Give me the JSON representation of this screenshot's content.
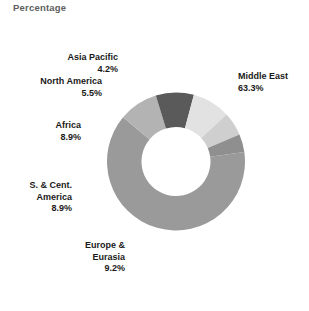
{
  "chart_title": "Percentage",
  "chart_data": {
    "type": "pie",
    "variant": "donut",
    "title": "Percentage",
    "subtitle": "",
    "xlabel": "",
    "ylabel": "",
    "units": "percent",
    "total": 100.0,
    "legend_position": "callout-labels",
    "grid": false,
    "start_angle_deg": -8,
    "direction": "clockwise",
    "inner_radius_ratio": 0.5,
    "categories": [
      "Middle East",
      "Europe & Eurasia",
      "S. & Cent. America",
      "Africa",
      "North America",
      "Asia Pacific"
    ],
    "values": [
      63.3,
      9.2,
      8.9,
      8.9,
      5.5,
      4.2
    ],
    "value_labels": [
      "63.3%",
      "9.2%",
      "8.9%",
      "8.9%",
      "5.5%",
      "4.2%"
    ],
    "colors": [
      "#9a9a9a",
      "#b3b3b3",
      "#5a5a5a",
      "#e2e2e2",
      "#cfcfcf",
      "#8f8f8f"
    ],
    "slices": [
      {
        "label": "Middle East",
        "label_line1": "Middle East",
        "value": 63.3,
        "value_label": "63.3%",
        "color": "#9a9a9a"
      },
      {
        "label": "Europe & Eurasia",
        "label_line1": "Europe &",
        "label_line2": "Eurasia",
        "value": 9.2,
        "value_label": "9.2%",
        "color": "#b3b3b3"
      },
      {
        "label": "S. & Cent. America",
        "label_line1": "S. & Cent.",
        "label_line2": "America",
        "value": 8.9,
        "value_label": "8.9%",
        "color": "#5a5a5a"
      },
      {
        "label": "Africa",
        "label_line1": "Africa",
        "value": 8.9,
        "value_label": "8.9%",
        "color": "#e2e2e2"
      },
      {
        "label": "North America",
        "label_line1": "North America",
        "value": 5.5,
        "value_label": "5.5%",
        "color": "#cfcfcf"
      },
      {
        "label": "Asia Pacific",
        "label_line1": "Asia Pacific",
        "value": 4.2,
        "value_label": "4.2%",
        "color": "#8f8f8f"
      }
    ]
  },
  "colors": {
    "title": "#5e5e5e",
    "label_text": "#1a1a1a",
    "background": "#ffffff",
    "middle_east": "#9a9a9a",
    "europe_eurasia": "#b3b3b3",
    "s_cent_america": "#5a5a5a",
    "africa": "#e2e2e2",
    "north_america": "#cfcfcf",
    "asia_pacific": "#8f8f8f"
  }
}
